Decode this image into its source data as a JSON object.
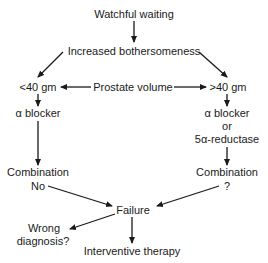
{
  "diagram": {
    "type": "flowchart",
    "nodes": {
      "watchful_waiting": "Watchful waiting",
      "increased_bothersomeness": "Increased bothersomeness",
      "lt40": "<40 gm",
      "prostate_volume": "Prostate volume",
      "gt40": ">40 gm",
      "left_alpha_blocker": "α blocker",
      "right_alpha_blocker": "α blocker",
      "right_or": "or",
      "right_5ar": "5α-reductase",
      "left_combination": "Combination",
      "left_combination_note": "No",
      "right_combination": "Combination",
      "right_combination_note": "?",
      "failure": "Failure",
      "wrong_diagnosis_1": "Wrong",
      "wrong_diagnosis_2": "diagnosis?",
      "interventive_therapy": "Interventive therapy"
    },
    "edges": [
      {
        "from": "Watchful waiting",
        "to": "Increased bothersomeness"
      },
      {
        "from": "Increased bothersomeness",
        "to": "<40 gm"
      },
      {
        "from": "Increased bothersomeness",
        "to": ">40 gm"
      },
      {
        "from": "Prostate volume",
        "to": "<40 gm"
      },
      {
        "from": "Prostate volume",
        "to": ">40 gm"
      },
      {
        "from": "<40 gm",
        "to": "α blocker"
      },
      {
        "from": ">40 gm",
        "to": "α blocker or 5α-reductase"
      },
      {
        "from": "α blocker",
        "to": "Combination No"
      },
      {
        "from": "α blocker or 5α-reductase",
        "to": "Combination ?"
      },
      {
        "from": "Combination No",
        "to": "Failure"
      },
      {
        "from": "Combination ?",
        "to": "Failure"
      },
      {
        "from": "Failure",
        "to": "Wrong diagnosis?"
      },
      {
        "from": "Failure",
        "to": "Interventive therapy"
      }
    ],
    "colors": {
      "line": "#1a1a1a",
      "background": "#ffffff"
    }
  }
}
